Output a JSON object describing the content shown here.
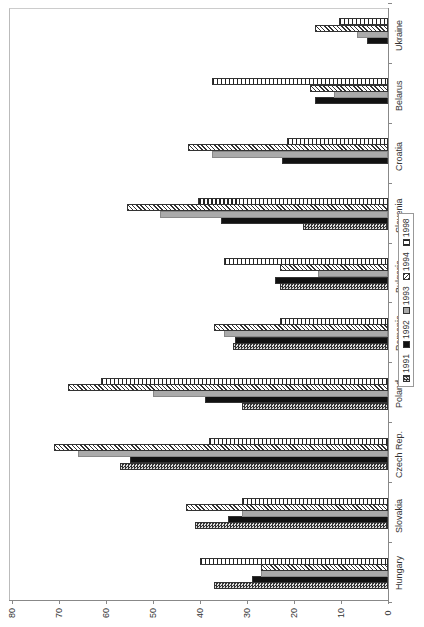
{
  "chart_data": {
    "type": "bar",
    "orientation": "horizontal (rotated page, categories along right edge)",
    "title": "",
    "xlabel": "",
    "ylabel": "",
    "categories": [
      "Hungary",
      "Slovakia",
      "Czech Rep.",
      "Poland",
      "Romania",
      "Bulgaria",
      "Slovenia",
      "Croatia",
      "Belarus",
      "Ukraine"
    ],
    "series": [
      {
        "name": "1991",
        "values": [
          37,
          41,
          57,
          31,
          33,
          23,
          18,
          null,
          null,
          null
        ]
      },
      {
        "name": "1992",
        "values": [
          29,
          34,
          55,
          39,
          32.5,
          24,
          35.5,
          22.5,
          15.5,
          4.5
        ]
      },
      {
        "name": "1993",
        "values": [
          27,
          31,
          66,
          50,
          35,
          15,
          48.5,
          37.5,
          11.5,
          6.5
        ]
      },
      {
        "name": "1994",
        "values": [
          27,
          43,
          71,
          68,
          37,
          23,
          55.5,
          42.5,
          16.5,
          15.5
        ]
      },
      {
        "name": "1998",
        "values": [
          40,
          31,
          38,
          61,
          23,
          35,
          40.5,
          21.5,
          37.5,
          10.5
        ]
      }
    ],
    "value_axis": {
      "range": [
        0,
        80
      ],
      "ticks": [
        "0",
        "10",
        "20",
        "30",
        "40",
        "50",
        "60",
        "70",
        "80"
      ]
    },
    "grid": false,
    "legend": {
      "position": "right",
      "entries": [
        "1991",
        "1992",
        "1993",
        "1994",
        "1998"
      ]
    }
  }
}
